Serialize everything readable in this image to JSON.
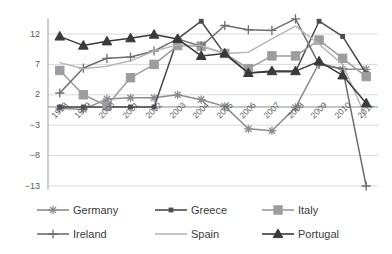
{
  "chart_data": {
    "type": "line",
    "title": "",
    "subtitle": "",
    "xlabel": "",
    "ylabel": "",
    "x": [
      "1998",
      "1999",
      "2000",
      "2001",
      "2002",
      "2003",
      "2004",
      "2005",
      "2006",
      "2007",
      "2008",
      "2009",
      "2010",
      "2011"
    ],
    "categories": [
      "1998",
      "1999",
      "2000",
      "2001",
      "2002",
      "2003",
      "2004",
      "2005",
      "2006",
      "2007",
      "2008",
      "2009",
      "2010",
      "2011"
    ],
    "yticks": [
      12,
      7,
      2,
      -3,
      -8,
      -13
    ],
    "ylim": [
      -13,
      14.5
    ],
    "grid": true,
    "zero_line": true,
    "legend_position": "bottom",
    "legend_columns": 3,
    "series": [
      {
        "name": "Germany",
        "marker": "asterisk",
        "color": "#8c8c8e",
        "values": [
          -0.2,
          -0.4,
          1.3,
          1.5,
          1.5,
          2.0,
          1.2,
          0.1,
          -3.6,
          -3.9,
          -0.1,
          7.2,
          6.2,
          6.2
        ]
      },
      {
        "name": "Greece",
        "marker": "small-diamond",
        "color": "#4a4a4c",
        "values": [
          0.0,
          0.0,
          0.0,
          0.0,
          0.0,
          11.2,
          14.1,
          8.7,
          5.6,
          5.8,
          5.8,
          14.1,
          11.6,
          5.5
        ]
      },
      {
        "name": "Italy",
        "marker": "square",
        "color": "#9d9d9f",
        "values": [
          6.0,
          2.0,
          0.2,
          4.8,
          7.0,
          10.1,
          10.0,
          8.8,
          6.3,
          8.4,
          8.4,
          11.0,
          8.0,
          5.0
        ]
      },
      {
        "name": "Ireland",
        "marker": "plus",
        "color": "#6e6e70",
        "values": [
          2.3,
          6.4,
          8.0,
          8.2,
          9.2,
          11.2,
          10.0,
          13.4,
          12.7,
          12.6,
          14.5,
          7.0,
          6.3,
          -13.0
        ]
      },
      {
        "name": "Spain",
        "marker": "none",
        "color": "#b6b6b8",
        "values": [
          7.3,
          6.3,
          6.7,
          7.6,
          9.2,
          10.2,
          10.1,
          8.8,
          9.0,
          11.2,
          13.3,
          10.3,
          7.0,
          -1.8
        ]
      },
      {
        "name": "Portugal",
        "marker": "triangle",
        "color": "#3a3a3c",
        "values": [
          11.6,
          10.1,
          10.8,
          11.3,
          11.9,
          11.2,
          8.4,
          8.8,
          5.6,
          5.9,
          5.9,
          7.5,
          5.2,
          0.6
        ]
      }
    ],
    "colors": {
      "germany": "#8c8c8e",
      "greece": "#4a4a4c",
      "italy": "#9d9d9f",
      "ireland": "#6e6e70",
      "spain": "#b6b6b8",
      "portugal": "#3a3a3c",
      "grid": "#d9d9db",
      "axis": "#a0a0a2",
      "text": "#58585a"
    }
  },
  "axis": {
    "y_labels": [
      "12",
      "7",
      "2",
      "−3",
      "−8",
      "−13"
    ],
    "x_labels": [
      "1998",
      "1999",
      "2000",
      "2001",
      "2002",
      "2003",
      "2004",
      "2005",
      "2006",
      "2007",
      "2008",
      "2009",
      "2010",
      "2011"
    ]
  },
  "legend": {
    "items": [
      {
        "label": "Germany",
        "marker": "asterisk",
        "color": "#8c8c8e"
      },
      {
        "label": "Greece",
        "marker": "small-diamond",
        "color": "#4a4a4c"
      },
      {
        "label": "Italy",
        "marker": "square",
        "color": "#9d9d9f"
      },
      {
        "label": "Ireland",
        "marker": "plus",
        "color": "#6e6e70"
      },
      {
        "label": "Spain",
        "marker": "none",
        "color": "#b6b6b8"
      },
      {
        "label": "Portugal",
        "marker": "triangle",
        "color": "#3a3a3c"
      }
    ]
  }
}
